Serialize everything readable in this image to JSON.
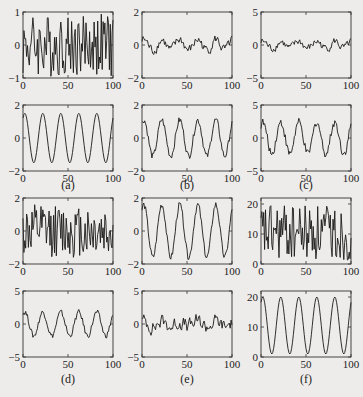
{
  "figure": {
    "captions": [
      "(a)",
      "(b)",
      "(c)",
      "(d)",
      "(e)",
      "(f)"
    ]
  },
  "chart_data": [
    {
      "id": "a-top",
      "panel": "(a)",
      "row": 0,
      "col": 0,
      "type": "line",
      "signal": "noise",
      "xlim": [
        0,
        100
      ],
      "ylim": [
        -1,
        1
      ],
      "xticks": [
        0,
        50,
        100
      ],
      "yticks": [
        -1,
        0,
        1
      ],
      "amp": 0.95,
      "offset": 0,
      "seed": 3,
      "period": 0,
      "noise": 1.0
    },
    {
      "id": "b-top",
      "panel": "(b)",
      "row": 0,
      "col": 1,
      "type": "line",
      "signal": "smoothnoise",
      "xlim": [
        0,
        100
      ],
      "ylim": [
        -2,
        2
      ],
      "xticks": [
        0,
        50,
        100
      ],
      "yticks": [
        -2,
        0,
        2
      ],
      "amp": 0.55,
      "offset": 0,
      "seed": 7,
      "period": 20,
      "noise": 0.35
    },
    {
      "id": "c-top",
      "panel": "(c)",
      "row": 0,
      "col": 2,
      "type": "line",
      "signal": "smoothnoise",
      "xlim": [
        0,
        100
      ],
      "ylim": [
        -5,
        5
      ],
      "xticks": [
        0,
        50,
        100
      ],
      "yticks": [
        -5,
        0,
        5
      ],
      "amp": 0.9,
      "offset": 0,
      "seed": 7,
      "period": 20,
      "noise": 0.7
    },
    {
      "id": "a-bottom",
      "panel": "(a)",
      "row": 1,
      "col": 0,
      "type": "line",
      "signal": "sine",
      "xlim": [
        0,
        100
      ],
      "ylim": [
        -2,
        2
      ],
      "xticks": [
        0,
        50,
        100
      ],
      "yticks": [
        -2,
        0,
        2
      ],
      "amp": 1.5,
      "offset": 0,
      "seed": 0,
      "period": 20,
      "noise": 0
    },
    {
      "id": "b-bottom",
      "panel": "(b)",
      "row": 1,
      "col": 1,
      "type": "line",
      "signal": "sine+noise",
      "xlim": [
        0,
        100
      ],
      "ylim": [
        -2,
        2
      ],
      "xticks": [
        0,
        50,
        100
      ],
      "yticks": [
        -2,
        0,
        2
      ],
      "amp": 1.1,
      "offset": 0,
      "seed": 5,
      "period": 20,
      "noise": 0.2
    },
    {
      "id": "c-bottom",
      "panel": "(c)",
      "row": 1,
      "col": 2,
      "type": "line",
      "signal": "sine+noise",
      "xlim": [
        0,
        100
      ],
      "ylim": [
        -5,
        5
      ],
      "xticks": [
        0,
        50,
        100
      ],
      "yticks": [
        -5,
        0,
        5
      ],
      "amp": 2.4,
      "offset": 0,
      "seed": 9,
      "period": 20,
      "noise": 0.6
    },
    {
      "id": "d-top",
      "panel": "(d)",
      "row": 2,
      "col": 0,
      "type": "line",
      "signal": "noise",
      "xlim": [
        0,
        100
      ],
      "ylim": [
        -2,
        2
      ],
      "xticks": [
        0,
        50,
        100
      ],
      "yticks": [
        -2,
        0,
        2
      ],
      "amp": 1.6,
      "offset": 0,
      "seed": 11,
      "period": 0,
      "noise": 1.0
    },
    {
      "id": "e-top",
      "panel": "(e)",
      "row": 2,
      "col": 1,
      "type": "line",
      "signal": "sine+noise",
      "xlim": [
        0,
        100
      ],
      "ylim": [
        -2,
        2
      ],
      "xticks": [
        0,
        50,
        100
      ],
      "yticks": [
        -2,
        0,
        2
      ],
      "amp": 1.6,
      "offset": 0,
      "seed": 13,
      "period": 20,
      "noise": 0.2
    },
    {
      "id": "f-top",
      "panel": "(f)",
      "row": 2,
      "col": 2,
      "type": "line",
      "signal": "noise",
      "xlim": [
        0,
        100
      ],
      "ylim": [
        0,
        22
      ],
      "xticks": [
        0,
        50,
        100
      ],
      "yticks": [
        0,
        10,
        20
      ],
      "amp": 9.5,
      "offset": 10.5,
      "seed": 17,
      "period": 0,
      "noise": 1.0
    },
    {
      "id": "d-bottom",
      "panel": "(d)",
      "row": 3,
      "col": 0,
      "type": "line",
      "signal": "sine+noise",
      "xlim": [
        0,
        100
      ],
      "ylim": [
        -5,
        5
      ],
      "xticks": [
        0,
        50,
        100
      ],
      "yticks": [
        -5,
        0,
        5
      ],
      "amp": 1.8,
      "offset": 0,
      "seed": 19,
      "period": 20,
      "noise": 0.4
    },
    {
      "id": "e-bottom",
      "panel": "(e)",
      "row": 3,
      "col": 1,
      "type": "line",
      "signal": "smoothnoise",
      "xlim": [
        0,
        100
      ],
      "ylim": [
        -5,
        5
      ],
      "xticks": [
        0,
        50,
        100
      ],
      "yticks": [
        -5,
        0,
        5
      ],
      "amp": 0.6,
      "offset": 0,
      "seed": 23,
      "period": 20,
      "noise": 1.2
    },
    {
      "id": "f-bottom",
      "panel": "(f)",
      "row": 3,
      "col": 2,
      "type": "line",
      "signal": "sine",
      "xlim": [
        0,
        100
      ],
      "ylim": [
        0,
        22
      ],
      "xticks": [
        0,
        50,
        100
      ],
      "yticks": [
        0,
        10,
        20
      ],
      "amp": 9.5,
      "offset": 10.5,
      "seed": 0,
      "period": 20,
      "noise": 0
    }
  ]
}
